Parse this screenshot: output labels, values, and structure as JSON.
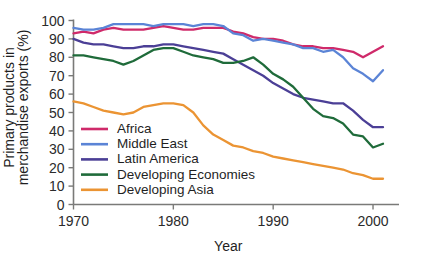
{
  "chart_data": {
    "type": "line",
    "title": "",
    "xlabel": "Year",
    "ylabel": "Primary products in merchandise exports (%)",
    "ylabel_line1": "Primary products in",
    "ylabel_line2": "merchandise exports (%)",
    "xlim": [
      1970,
      2001
    ],
    "ylim": [
      0,
      100
    ],
    "xticks": [
      1970,
      1980,
      1990,
      2000
    ],
    "xtick_labels": [
      "1970",
      "1980",
      "1990",
      "2000"
    ],
    "yticks": [
      0,
      10,
      20,
      30,
      40,
      50,
      60,
      70,
      80,
      90,
      100
    ],
    "ytick_labels": [
      "0",
      "10",
      "20",
      "30",
      "40",
      "50",
      "60",
      "70",
      "80",
      "90",
      "100"
    ],
    "grid": false,
    "legend_position": "inside-lower-left",
    "x": [
      1970,
      1971,
      1972,
      1973,
      1974,
      1975,
      1976,
      1977,
      1978,
      1979,
      1980,
      1981,
      1982,
      1983,
      1984,
      1985,
      1986,
      1987,
      1988,
      1989,
      1990,
      1991,
      1992,
      1993,
      1994,
      1995,
      1996,
      1997,
      1998,
      1999,
      2000,
      2001
    ],
    "series": [
      {
        "name": "Africa",
        "color": "#cf2a6a",
        "values": [
          93,
          94,
          93,
          95,
          96,
          95,
          95,
          95,
          96,
          97,
          96,
          95,
          95,
          96,
          96,
          96,
          94,
          93,
          91,
          90,
          90,
          89,
          87,
          86,
          86,
          85,
          85,
          84,
          83,
          80,
          83,
          86
        ]
      },
      {
        "name": "Middle East",
        "color": "#5b84d6",
        "values": [
          96,
          95,
          95,
          96,
          98,
          98,
          98,
          98,
          97,
          98,
          98,
          98,
          97,
          98,
          98,
          97,
          93,
          92,
          89,
          90,
          89,
          88,
          87,
          85,
          85,
          83,
          84,
          80,
          74,
          71,
          67,
          73
        ]
      },
      {
        "name": "Latin America",
        "color": "#4b3f96",
        "values": [
          90,
          88,
          87,
          87,
          86,
          85,
          85,
          86,
          86,
          87,
          87,
          86,
          85,
          84,
          83,
          82,
          79,
          76,
          73,
          70,
          66,
          63,
          60,
          58,
          57,
          56,
          55,
          55,
          51,
          46,
          42,
          42
        ]
      },
      {
        "name": "Developing Economies",
        "color": "#1f6b3a",
        "values": [
          81,
          81,
          80,
          79,
          78,
          76,
          78,
          81,
          84,
          85,
          85,
          83,
          81,
          80,
          79,
          77,
          77,
          78,
          80,
          76,
          71,
          68,
          64,
          58,
          52,
          48,
          47,
          44,
          38,
          37,
          31,
          33
        ]
      },
      {
        "name": "Developing Asia",
        "color": "#eb9433",
        "values": [
          56,
          55,
          53,
          51,
          50,
          49,
          50,
          53,
          54,
          55,
          55,
          54,
          50,
          43,
          38,
          35,
          32,
          31,
          29,
          28,
          26,
          25,
          24,
          23,
          22,
          21,
          20,
          19,
          17,
          16,
          14,
          14
        ]
      }
    ]
  },
  "legend": {
    "items": [
      {
        "label": "Africa",
        "color": "#cf2a6a"
      },
      {
        "label": "Middle East",
        "color": "#5b84d6"
      },
      {
        "label": "Latin America",
        "color": "#4b3f96"
      },
      {
        "label": "Developing Economies",
        "color": "#1f6b3a"
      },
      {
        "label": "Developing Asia",
        "color": "#eb9433"
      }
    ]
  }
}
